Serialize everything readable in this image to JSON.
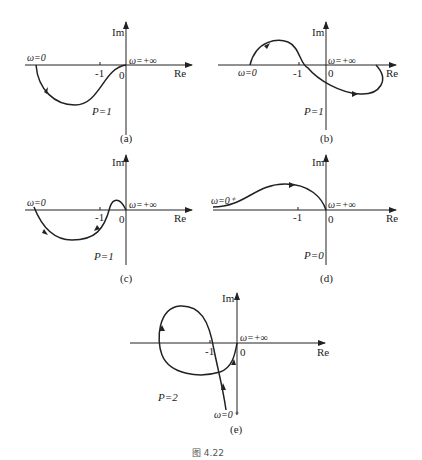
{
  "figure_caption": "图 4.22",
  "panels": [
    {
      "id": "a",
      "label": "(a)",
      "axis_x": "Re",
      "axis_y": "Im",
      "origin": "0",
      "minus_one": "-1",
      "start": "ω=0",
      "end": "ω=+∞",
      "P": "P=1"
    },
    {
      "id": "b",
      "label": "(b)",
      "axis_x": "Re",
      "axis_y": "Im",
      "origin": "0",
      "minus_one": "-1",
      "start": "ω=0",
      "end": "ω=+∞",
      "P": "P=1"
    },
    {
      "id": "c",
      "label": "(c)",
      "axis_x": "Re",
      "axis_y": "Im",
      "origin": "0",
      "minus_one": "-1",
      "start": "ω=0",
      "end": "ω=+∞",
      "P": "P=1"
    },
    {
      "id": "d",
      "label": "(d)",
      "axis_x": "Re",
      "axis_y": "Im",
      "origin": "0",
      "minus_one": "-1",
      "start": "ω=0⁺",
      "end": "ω=+∞",
      "P": "P=0"
    },
    {
      "id": "e",
      "label": "(e)",
      "axis_x": "Re",
      "axis_y": "Im",
      "origin": "0",
      "minus_one": "-1",
      "start": "ω=0⁺",
      "end": "ω=+∞",
      "P": "P=2"
    }
  ]
}
